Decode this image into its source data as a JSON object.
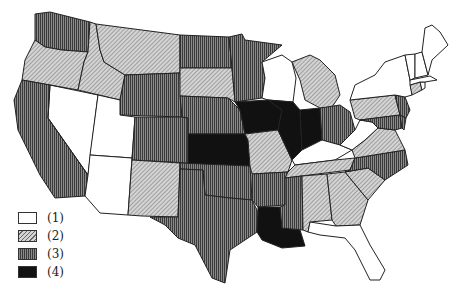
{
  "map": {
    "type": "choropleth",
    "region": "United States (contiguous)",
    "classes": [
      {
        "id": 1,
        "label": "(1)",
        "fill": "white"
      },
      {
        "id": 2,
        "label": "(2)",
        "fill": "light-diagonal-hatch"
      },
      {
        "id": 3,
        "label": "(3)",
        "fill": "dark-vertical-hatch"
      },
      {
        "id": 4,
        "label": "(4)",
        "fill": "black"
      }
    ],
    "states": {
      "WA": 3,
      "OR": 2,
      "ID": 2,
      "MT": 2,
      "WY": 3,
      "CA": 3,
      "NV": 1,
      "UT": 1,
      "AZ": 1,
      "CO": 3,
      "NM": 2,
      "ND": 3,
      "SD": 2,
      "NE": 3,
      "KS": 4,
      "OK": 3,
      "TX": 3,
      "MN": 3,
      "IA": 4,
      "MO": 2,
      "AR": 3,
      "LA": 4,
      "WI": 1,
      "IL": 4,
      "MS": 3,
      "MI": 2,
      "IN": 4,
      "OH": 3,
      "KY": 1,
      "TN": 2,
      "AL": 2,
      "GA": 2,
      "FL": 1,
      "SC": 2,
      "NC": 3,
      "VA": 2,
      "WV": 1,
      "PA": 2,
      "NY": 1,
      "NJ": 3,
      "DE": 3,
      "MD": 3,
      "CT": 2,
      "RI": 1,
      "MA": 1,
      "VT": 1,
      "NH": 1,
      "ME": 1
    }
  },
  "legend": {
    "items": [
      {
        "label": "(1)",
        "class": 1
      },
      {
        "label": "(2)",
        "class": 2
      },
      {
        "label": "(3)",
        "class": 3
      },
      {
        "label": "(4)",
        "class": 4
      }
    ]
  }
}
